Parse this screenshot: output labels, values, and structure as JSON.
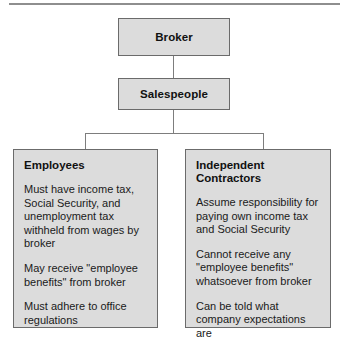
{
  "diagram": {
    "type": "organizational-hierarchy",
    "top_rule_color": "#8e8e8e",
    "box_fill_color": "#dcdcdc",
    "box_border_color": "#6b6b6b",
    "connector_color": "#7d7d7d",
    "background_color": "#ffffff",
    "nodes": {
      "broker": {
        "label": "Broker"
      },
      "salespeople": {
        "label": "Salespeople"
      }
    },
    "panels": [
      {
        "id": "employees",
        "heading": "Employees",
        "items": [
          "Must have income tax, Social Security, and unemployment tax withheld from wages by broker",
          "May receive \"employee benefits\" from broker",
          "Must adhere to office regulations"
        ]
      },
      {
        "id": "contractors",
        "heading": "Independent\nContractors",
        "items": [
          "Assume responsibility for paying own income tax and Social Security",
          "Cannot receive any \"employee benefits\" whatsoever from broker",
          "Can be told what company expectations are"
        ]
      }
    ]
  }
}
